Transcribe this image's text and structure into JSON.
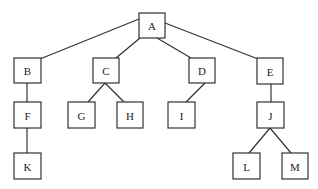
{
  "diagram": {
    "type": "tree",
    "root": "A",
    "nodes": [
      {
        "id": "A",
        "label": "A",
        "x": 139,
        "y": 13,
        "w": 26,
        "h": 25
      },
      {
        "id": "B",
        "label": "B",
        "x": 14,
        "y": 58,
        "w": 27,
        "h": 25
      },
      {
        "id": "C",
        "label": "C",
        "x": 93,
        "y": 58,
        "w": 26,
        "h": 25
      },
      {
        "id": "D",
        "label": "D",
        "x": 189,
        "y": 58,
        "w": 26,
        "h": 25
      },
      {
        "id": "E",
        "label": "E",
        "x": 257,
        "y": 58,
        "w": 26,
        "h": 26
      },
      {
        "id": "F",
        "label": "F",
        "x": 14,
        "y": 102,
        "w": 27,
        "h": 26
      },
      {
        "id": "G",
        "label": "G",
        "x": 68,
        "y": 102,
        "w": 27,
        "h": 26
      },
      {
        "id": "H",
        "label": "H",
        "x": 117,
        "y": 102,
        "w": 26,
        "h": 26
      },
      {
        "id": "I",
        "label": "I",
        "x": 168,
        "y": 102,
        "w": 27,
        "h": 26
      },
      {
        "id": "J",
        "label": "J",
        "x": 257,
        "y": 102,
        "w": 27,
        "h": 26
      },
      {
        "id": "K",
        "label": "K",
        "x": 14,
        "y": 153,
        "w": 27,
        "h": 26
      },
      {
        "id": "L",
        "label": "L",
        "x": 233,
        "y": 153,
        "w": 27,
        "h": 26
      },
      {
        "id": "M",
        "label": "M",
        "x": 282,
        "y": 153,
        "w": 26,
        "h": 26
      }
    ],
    "edges": [
      {
        "from": "A",
        "to": "B",
        "x1": 139,
        "y1": 19,
        "x2": 40,
        "y2": 59
      },
      {
        "from": "A",
        "to": "C",
        "x1": 140,
        "y1": 38,
        "x2": 116,
        "y2": 58
      },
      {
        "from": "A",
        "to": "D",
        "x1": 157,
        "y1": 38,
        "x2": 191,
        "y2": 58
      },
      {
        "from": "A",
        "to": "E",
        "x1": 165,
        "y1": 23,
        "x2": 258,
        "y2": 59
      },
      {
        "from": "B",
        "to": "F",
        "x1": 27,
        "y1": 83,
        "x2": 27,
        "y2": 102
      },
      {
        "from": "C",
        "to": "G",
        "x1": 105,
        "y1": 83,
        "x2": 88,
        "y2": 102
      },
      {
        "from": "C",
        "to": "H",
        "x1": 105,
        "y1": 83,
        "x2": 124,
        "y2": 102
      },
      {
        "from": "D",
        "to": "I",
        "x1": 205,
        "y1": 83,
        "x2": 186,
        "y2": 102
      },
      {
        "from": "E",
        "to": "J",
        "x1": 271,
        "y1": 84,
        "x2": 271,
        "y2": 102
      },
      {
        "from": "F",
        "to": "K",
        "x1": 27,
        "y1": 128,
        "x2": 27,
        "y2": 153
      },
      {
        "from": "J",
        "to": "L",
        "x1": 270,
        "y1": 128,
        "x2": 249,
        "y2": 153
      },
      {
        "from": "J",
        "to": "M",
        "x1": 270,
        "y1": 128,
        "x2": 291,
        "y2": 153
      }
    ],
    "colors": {
      "stroke": "#333333",
      "fill": "#ffffff",
      "text": "#222222"
    }
  }
}
